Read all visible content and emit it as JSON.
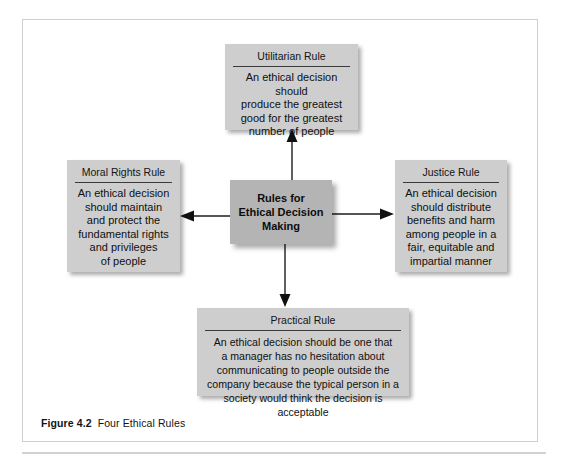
{
  "figure": {
    "caption_label": "Figure 4.2",
    "caption_text": "Four Ethical Rules",
    "colors": {
      "node_fill": "#cecece",
      "center_fill": "#b4b4b4",
      "frame_border": "#cfcfcf",
      "arrow": "#1c1c1c",
      "text": "#141414"
    }
  },
  "center": {
    "title": "Rules for\nEthical Decision\nMaking"
  },
  "nodes": {
    "utilitarian": {
      "title": "Utilitarian Rule",
      "body": "An ethical decision should\nproduce the greatest\ngood for the greatest\nnumber of people"
    },
    "moral_rights": {
      "title": "Moral Rights Rule",
      "body": "An ethical decision\nshould maintain\nand protect the\nfundamental rights\nand privileges\nof people"
    },
    "justice": {
      "title": "Justice Rule",
      "body": "An ethical decision\nshould distribute\nbenefits and harm\namong people in a\nfair, equitable and\nimpartial manner"
    },
    "practical": {
      "title": "Practical Rule",
      "body": "An ethical decision should be one that\na manager has no hesitation about\ncommunicating to people outside the\ncompany because the typical person in a\nsociety would think the decision is acceptable"
    }
  },
  "arrows": [
    {
      "name": "arrow-to-utilitarian",
      "direction": "up"
    },
    {
      "name": "arrow-to-practical",
      "direction": "down"
    },
    {
      "name": "arrow-to-moral-rights",
      "direction": "left"
    },
    {
      "name": "arrow-to-justice",
      "direction": "right"
    }
  ]
}
